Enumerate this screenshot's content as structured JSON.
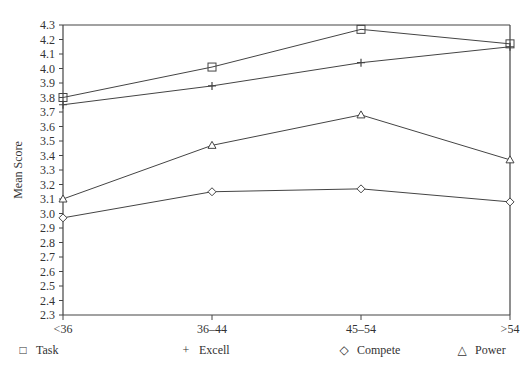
{
  "chart_data": {
    "type": "line",
    "title": "",
    "xlabel": "Age Group",
    "ylabel": "Mean Score",
    "categories": [
      "<36",
      "36–44",
      "45–54",
      ">54"
    ],
    "ylim": [
      2.3,
      4.3
    ],
    "yticks": [
      "4.3",
      "4.2",
      "4.1",
      "4.0",
      "3.9",
      "3.8",
      "3.7",
      "3.6",
      "3.5",
      "3.4",
      "3.3",
      "3.2",
      "3.1",
      "3.0",
      "2.9",
      "2.8",
      "2.7",
      "2.6",
      "2.5",
      "2.4",
      "2.3"
    ],
    "grid": false,
    "legend_position": "bottom",
    "series": [
      {
        "name": "Task",
        "marker": "square",
        "values": [
          3.8,
          4.01,
          4.27,
          4.17
        ]
      },
      {
        "name": "Excell",
        "marker": "plus",
        "values": [
          3.75,
          3.88,
          4.04,
          4.15
        ]
      },
      {
        "name": "Compete",
        "marker": "diamond",
        "values": [
          2.97,
          3.15,
          3.17,
          3.08
        ]
      },
      {
        "name": "Power",
        "marker": "triangle",
        "values": [
          3.1,
          3.47,
          3.68,
          3.37
        ]
      }
    ]
  },
  "legend": [
    {
      "symbol": "□",
      "label": "Task"
    },
    {
      "symbol": "+",
      "label": "Excell"
    },
    {
      "symbol": "◇",
      "label": "Compete"
    },
    {
      "symbol": "△",
      "label": "Power"
    }
  ]
}
